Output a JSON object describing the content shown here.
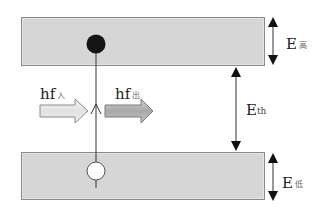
{
  "diagram": {
    "type": "energy-band-diagram",
    "bands": {
      "upper": {
        "label_main": "E",
        "label_sub": "高",
        "fill": "#d6d6d6",
        "border": "#8a8a8a"
      },
      "lower": {
        "label_main": "E",
        "label_sub": "低",
        "fill": "#d6d6d6",
        "border": "#8a8a8a"
      }
    },
    "gap": {
      "label_main": "E",
      "label_sub": "th"
    },
    "photons": {
      "incoming": {
        "label_main": "hf",
        "label_sub": "入",
        "fill": "#ededed"
      },
      "outgoing": {
        "label_main": "hf",
        "label_sub": "出",
        "fill": "#b8b8b8"
      }
    },
    "particles": {
      "electron": {
        "state": "filled",
        "color": "#111111",
        "position": "upper band"
      },
      "hole": {
        "state": "empty",
        "color": "#ffffff",
        "position": "lower band"
      }
    },
    "transition": {
      "direction": "upward",
      "from": "lower band",
      "to": "upper band"
    }
  }
}
